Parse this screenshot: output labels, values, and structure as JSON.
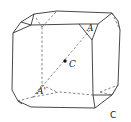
{
  "figure": {
    "labels": {
      "point_a": "A",
      "point_a_prime": "A'",
      "center": "C",
      "caption": "C"
    },
    "colors": {
      "line": "#333333",
      "background": "#ffffff"
    }
  }
}
